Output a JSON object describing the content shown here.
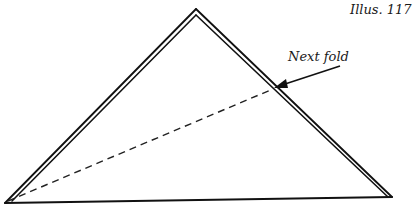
{
  "caption": "Illus. 117",
  "callout": {
    "label": "Next fold"
  },
  "colors": {
    "line": "#111111",
    "background": "#ffffff"
  },
  "shape": {
    "type": "triangle",
    "description": "folded paper triangle, double-layered sides",
    "apex": [
      196,
      9
    ],
    "bottom_left": [
      5,
      203
    ],
    "bottom_right": [
      392,
      197
    ]
  },
  "fold_line": {
    "style": "dashed",
    "from": [
      5,
      203
    ],
    "to": [
      273,
      89
    ]
  }
}
